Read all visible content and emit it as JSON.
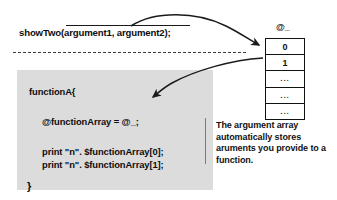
{
  "diagram": {
    "title_hidden": "Perl @_ argument array diagram",
    "call": {
      "text": "showTwo(argument1, argument2);"
    },
    "code": {
      "lines": [
        {
          "id": "fn-open",
          "text": "functionA{"
        },
        {
          "id": "assign",
          "text": "@functionArray = @_;"
        },
        {
          "id": "print-0",
          "text": "print \"n\". $functionArray[0];"
        },
        {
          "id": "print-1",
          "text": "print \"n\". $functionArray[1];"
        },
        {
          "id": "fn-close",
          "text": "}"
        }
      ],
      "background_color": "#dcdcdc"
    },
    "array": {
      "label": "@_",
      "cells": [
        "0",
        "1",
        "...",
        "...",
        "..."
      ]
    },
    "annotation": {
      "text": "The argument array automatically stores aruments you provide to a function."
    },
    "arrows": [
      {
        "name": "call-to-array-arrow",
        "from": "showTwo call",
        "to": "@_ array"
      },
      {
        "name": "array-to-code-arrow",
        "from": "@_ array",
        "to": "@functionArray = @_;"
      }
    ],
    "colors": {
      "ink": "#111111",
      "code_bg": "#dcdcdc",
      "dashed_rule": "#3a3a3a"
    }
  }
}
